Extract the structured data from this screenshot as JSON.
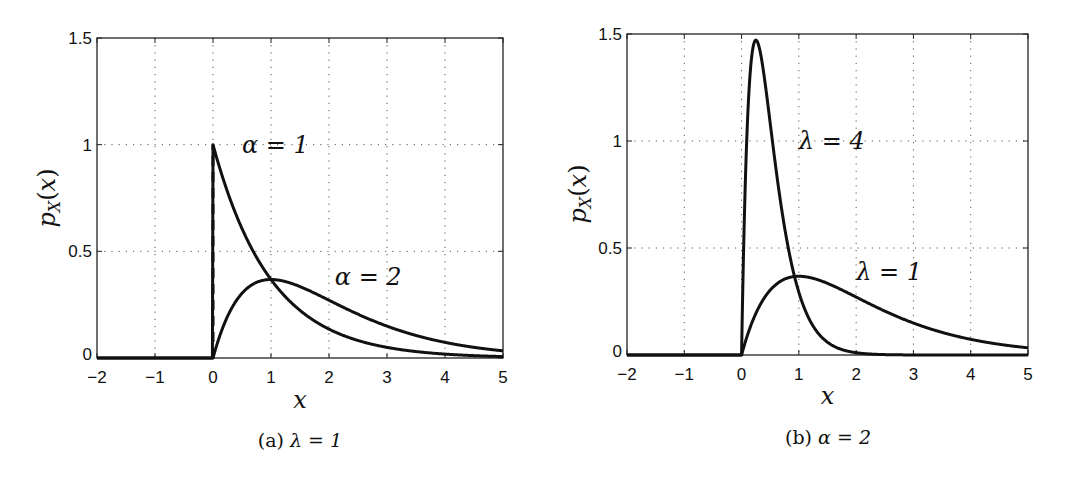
{
  "chart_data": [
    {
      "type": "line",
      "panel": "a",
      "caption": "(a) λ = 1",
      "caption_prefix": "(a)",
      "caption_math": "λ = 1",
      "xlabel": "x",
      "ylabel": "pX(x)",
      "xlim": [
        -2,
        5
      ],
      "ylim": [
        0,
        1.5
      ],
      "xticks": [
        "−2",
        "−1",
        "0",
        "1",
        "2",
        "3",
        "4",
        "5"
      ],
      "yticks": [
        "0",
        "0.5",
        "1",
        "1.5"
      ],
      "grid": true,
      "lambda": 1,
      "series": [
        {
          "name": "α = 1",
          "alpha": 1,
          "lambda": 1,
          "x": [
            0,
            0.5,
            1,
            1.5,
            2,
            3,
            4,
            5
          ],
          "y": [
            1.0,
            0.607,
            0.368,
            0.223,
            0.135,
            0.05,
            0.018,
            0.007
          ],
          "note": "dashed vertical line from 0 to 1 at x=0"
        },
        {
          "name": "α = 2",
          "alpha": 2,
          "lambda": 1,
          "x": [
            0,
            0.5,
            1,
            1.5,
            2,
            3,
            4,
            5
          ],
          "y": [
            0.0,
            0.303,
            0.368,
            0.335,
            0.271,
            0.149,
            0.073,
            0.034
          ]
        }
      ],
      "annotations": [
        {
          "text": "α = 1",
          "x": 0.5,
          "y": 1.0
        },
        {
          "text": "α = 2",
          "x": 2.1,
          "y": 0.38
        }
      ]
    },
    {
      "type": "line",
      "panel": "b",
      "caption": "(b) α = 2",
      "caption_prefix": "(b)",
      "caption_math": "α = 2",
      "xlabel": "x",
      "ylabel": "pX(x)",
      "xlim": [
        -2,
        5
      ],
      "ylim": [
        0,
        1.5
      ],
      "xticks": [
        "−2",
        "−1",
        "0",
        "1",
        "2",
        "3",
        "4",
        "5"
      ],
      "yticks": [
        "0",
        "0.5",
        "1",
        "1.5"
      ],
      "grid": true,
      "alpha": 2,
      "series": [
        {
          "name": "λ = 4",
          "alpha": 2,
          "lambda": 4,
          "x": [
            0,
            0.1,
            0.25,
            0.5,
            0.75,
            1,
            1.5,
            2
          ],
          "y": [
            0.0,
            1.073,
            1.472,
            1.083,
            0.597,
            0.293,
            0.059,
            0.011
          ]
        },
        {
          "name": "λ = 1",
          "alpha": 2,
          "lambda": 1,
          "x": [
            0,
            0.5,
            1,
            1.5,
            2,
            3,
            4,
            5
          ],
          "y": [
            0.0,
            0.303,
            0.368,
            0.335,
            0.271,
            0.149,
            0.073,
            0.034
          ]
        }
      ],
      "annotations": [
        {
          "text": "λ = 4",
          "x": 1.0,
          "y": 1.0
        },
        {
          "text": "λ = 1",
          "x": 2.0,
          "y": 0.39
        }
      ]
    }
  ]
}
